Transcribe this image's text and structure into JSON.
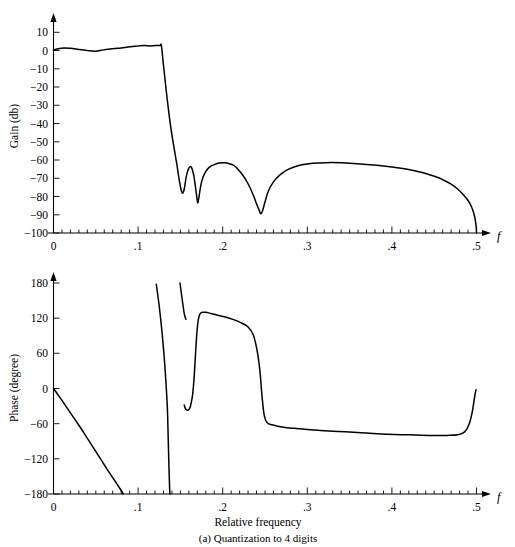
{
  "figure": {
    "caption": "(a) Quantization to 4 digits",
    "x_axis_title": "Relative frequency",
    "x_symbol": "f"
  },
  "gain_panel": {
    "y_axis_title": "Gain (db)",
    "y_ticks": [
      "10",
      "0",
      "−10",
      "−20",
      "−30",
      "−40",
      "−50",
      "−60",
      "−70",
      "−80",
      "−90",
      "−100"
    ],
    "x_ticks": [
      "0",
      ".1",
      ".2",
      ".3",
      ".4",
      ".5"
    ],
    "x_symbol": "f"
  },
  "phase_panel": {
    "y_axis_title": "Phase (degree)",
    "y_ticks": [
      "180",
      "120",
      "60",
      "0",
      "−60",
      "−120",
      "−180"
    ],
    "x_ticks": [
      "0",
      ".1",
      ".2",
      ".3",
      ".4",
      ".5"
    ],
    "x_symbol": "f"
  },
  "chart_data": [
    {
      "type": "line",
      "title": "",
      "panel": "gain",
      "xlabel": "f",
      "ylabel": "Gain (db)",
      "xlim": [
        0,
        0.5
      ],
      "ylim": [
        -100,
        10
      ],
      "xticks": [
        0,
        0.1,
        0.2,
        0.3,
        0.4,
        0.5
      ],
      "xticklabels": [
        "0",
        ".1",
        ".2",
        ".3",
        ".4",
        ".5"
      ],
      "yticks": [
        10,
        0,
        -10,
        -20,
        -30,
        -40,
        -50,
        -60,
        -70,
        -80,
        -90,
        -100
      ],
      "yticklabels": [
        "10",
        "0",
        "-10",
        "-20",
        "-30",
        "-40",
        "-50",
        "-60",
        "-70",
        "-80",
        "-90",
        "-100"
      ],
      "grid": false,
      "legend": "none",
      "series": [
        {
          "name": "Gain",
          "x": [
            0.0,
            0.006,
            0.012,
            0.02,
            0.03,
            0.04,
            0.048,
            0.056,
            0.064,
            0.072,
            0.08,
            0.088,
            0.096,
            0.102,
            0.108,
            0.113,
            0.118,
            0.122,
            0.126,
            0.1275,
            0.13,
            0.134,
            0.138,
            0.142,
            0.146,
            0.149,
            0.152,
            0.1545,
            0.157,
            0.16,
            0.163,
            0.166,
            0.169,
            0.1705,
            0.172,
            0.175,
            0.179,
            0.184,
            0.19,
            0.196,
            0.202,
            0.208,
            0.213,
            0.218,
            0.224,
            0.23,
            0.236,
            0.24,
            0.2435,
            0.245,
            0.247,
            0.25,
            0.254,
            0.26,
            0.268,
            0.278,
            0.29,
            0.302,
            0.315,
            0.328,
            0.34,
            0.355,
            0.37,
            0.385,
            0.4,
            0.415,
            0.428,
            0.44,
            0.452,
            0.462,
            0.47,
            0.478,
            0.484,
            0.489,
            0.493,
            0.496,
            0.498,
            0.4995,
            0.5
          ],
          "y": [
            0.3,
            1.0,
            1.4,
            1.2,
            0.6,
            0.0,
            -0.4,
            0.1,
            0.7,
            1.1,
            1.4,
            1.9,
            2.3,
            2.6,
            2.7,
            2.5,
            2.6,
            2.8,
            2.8,
            2.8,
            -8.0,
            -25.0,
            -40.0,
            -52.0,
            -63.0,
            -72.0,
            -78.0,
            -76.0,
            -69.0,
            -64.5,
            -64.0,
            -69.0,
            -79.0,
            -83.5,
            -80.0,
            -72.0,
            -67.0,
            -64.0,
            -62.5,
            -61.6,
            -61.5,
            -62.0,
            -63.0,
            -65.0,
            -68.5,
            -73.0,
            -79.0,
            -84.0,
            -88.0,
            -89.5,
            -88.0,
            -83.0,
            -77.0,
            -72.0,
            -68.0,
            -65.0,
            -63.0,
            -62.0,
            -61.6,
            -61.4,
            -61.5,
            -61.9,
            -62.4,
            -63.0,
            -63.8,
            -64.8,
            -66.0,
            -67.4,
            -69.2,
            -71.2,
            -73.2,
            -76.0,
            -78.8,
            -81.5,
            -84.5,
            -88.0,
            -91.5,
            -96.0,
            -100.0
          ]
        }
      ]
    },
    {
      "type": "line",
      "title": "",
      "panel": "phase",
      "xlabel": "Relative frequency",
      "ylabel": "Phase (degree)",
      "xlim": [
        0,
        0.5
      ],
      "ylim": [
        -180,
        180
      ],
      "xticks": [
        0,
        0.1,
        0.2,
        0.3,
        0.4,
        0.5
      ],
      "xticklabels": [
        "0",
        ".1",
        ".2",
        ".3",
        ".4",
        ".5"
      ],
      "yticks": [
        180,
        120,
        60,
        0,
        -60,
        -120,
        -180
      ],
      "yticklabels": [
        "180",
        "120",
        "60",
        "0",
        "-60",
        "-120",
        "-180"
      ],
      "grid": false,
      "legend": "none",
      "series": [
        {
          "name": "Phase branch 1",
          "x": [
            0.0,
            0.008,
            0.016,
            0.024,
            0.032,
            0.04,
            0.048,
            0.056,
            0.063,
            0.07,
            0.076,
            0.08,
            0.0825
          ],
          "y": [
            0,
            -16,
            -33,
            -50,
            -67,
            -85,
            -103,
            -121,
            -137,
            -152,
            -165,
            -174,
            -180
          ]
        },
        {
          "name": "Phase branch 2",
          "x": [
            0.1215,
            0.125,
            0.128,
            0.1305,
            0.1325,
            0.1345,
            0.1355,
            0.1365,
            0.1375
          ],
          "y": [
            178,
            140,
            100,
            60,
            20,
            -30,
            -80,
            -135,
            -180
          ]
        },
        {
          "name": "Phase branch 3",
          "x": [
            0.1495,
            0.1525,
            0.1545,
            0.156,
            0.1565
          ],
          "y": [
            180,
            148,
            128,
            120,
            118
          ]
        },
        {
          "name": "Phase branch 4",
          "x": [
            0.1545,
            0.1555,
            0.157,
            0.159,
            0.1605,
            0.1615,
            0.1625,
            0.1645,
            0.1665,
            0.168,
            0.1695,
            0.1712,
            0.1735,
            0.176,
            0.18,
            0.186,
            0.194,
            0.203,
            0.212,
            0.222,
            0.23,
            0.236,
            0.24,
            0.2425,
            0.2445,
            0.246,
            0.2475,
            0.249,
            0.251,
            0.254,
            0.258,
            0.264,
            0.272,
            0.285,
            0.3,
            0.32,
            0.345,
            0.37,
            0.395,
            0.42,
            0.445,
            0.465,
            0.478,
            0.486,
            0.491,
            0.495,
            0.498,
            0.4995
          ],
          "y": [
            -28,
            -33,
            -36,
            -37,
            -35,
            -32,
            -26,
            -10,
            25,
            62,
            95,
            118,
            128,
            130,
            130,
            128,
            125,
            122,
            118,
            112,
            105,
            92,
            70,
            48,
            22,
            -5,
            -28,
            -45,
            -55,
            -60,
            -62,
            -64,
            -66,
            -68,
            -70,
            -72,
            -74,
            -76,
            -78,
            -79,
            -80,
            -80,
            -79,
            -74,
            -62,
            -40,
            -12,
            -2
          ]
        }
      ]
    }
  ]
}
